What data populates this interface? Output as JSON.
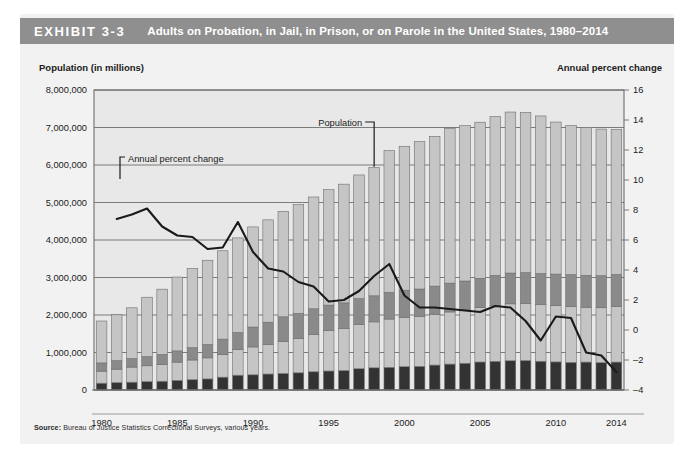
{
  "exhibit": {
    "label": "EXHIBIT 3-3",
    "title": "Adults on Probation, in Jail, in Prison, or on Parole in the United States, 1980–2014",
    "source_prefix": "Source:",
    "source_text": " Bureau of Justice Statistics Correctional Surveys, various years."
  },
  "axes": {
    "left_title": "Population (in millions)",
    "right_title": "Annual percent change"
  },
  "annotations": {
    "population": "Population",
    "annual_percent_change": "Annual percent change"
  },
  "colors": {
    "header_bar": "#8f8f8f",
    "panel_bg": "#f2f2f2",
    "plot_bg": "#e8e8e8",
    "jail": "#333333",
    "prison": "#c5c5c5",
    "parole": "#8a8a8a",
    "probation": "#c5c5c5",
    "line": "#1a1a1a",
    "grid": "#6e6e6e"
  },
  "chart_data": {
    "type": "bar",
    "title": "Adults on Probation, in Jail, in Prison, or on Parole in the United States, 1980–2014",
    "xlabel": "",
    "ylabel": "Population (in millions)",
    "y2label": "Annual percent change",
    "ylim": [
      0,
      8000000
    ],
    "y2lim": [
      -4,
      16
    ],
    "grid": true,
    "legend_position": "none",
    "ytick_labels": [
      "8,000,000",
      "7,000,000",
      "6,000,000",
      "5,000,000",
      "4,000,000",
      "3,000,000",
      "2,000,000",
      "1,000,000",
      "0"
    ],
    "ytick_values": [
      8000000,
      7000000,
      6000000,
      5000000,
      4000000,
      3000000,
      2000000,
      1000000,
      0
    ],
    "y2tick_labels": [
      "16",
      "14",
      "12",
      "10",
      "8",
      "6",
      "4",
      "2",
      "0",
      "–2",
      "–4"
    ],
    "y2tick_values": [
      16,
      14,
      12,
      10,
      8,
      6,
      4,
      2,
      0,
      -2,
      -4
    ],
    "xtick_labels": [
      "1980",
      "1985",
      "1990",
      "1995",
      "2000",
      "2005",
      "2010",
      "2014"
    ],
    "xtick_values": [
      1980,
      1985,
      1990,
      1995,
      2000,
      2005,
      2010,
      2014
    ],
    "categories": [
      1980,
      1981,
      1982,
      1983,
      1984,
      1985,
      1986,
      1987,
      1988,
      1989,
      1990,
      1991,
      1992,
      1993,
      1994,
      1995,
      1996,
      1997,
      1998,
      1999,
      2000,
      2001,
      2002,
      2003,
      2004,
      2005,
      2006,
      2007,
      2008,
      2009,
      2010,
      2011,
      2012,
      2013,
      2014
    ],
    "stack_order": [
      "jail",
      "prison",
      "parole",
      "probation"
    ],
    "series": [
      {
        "name": "Jail",
        "axis": "left",
        "color": "#333333",
        "values": [
          182000,
          196000,
          209000,
          223000,
          234000,
          256000,
          274000,
          295000,
          343000,
          395000,
          405000,
          426000,
          444000,
          459000,
          486000,
          507000,
          518000,
          567000,
          592000,
          605000,
          621000,
          631000,
          665000,
          691000,
          714000,
          747000,
          765000,
          780000,
          785000,
          767000,
          749000,
          736000,
          745000,
          731000,
          745000
        ]
      },
      {
        "name": "Prison",
        "axis": "left",
        "color": "#c5c5c5",
        "values": [
          320000,
          360000,
          402000,
          423000,
          449000,
          487000,
          526000,
          562000,
          607000,
          683000,
          743000,
          792000,
          850000,
          909000,
          990000,
          1078000,
          1127000,
          1176000,
          1224000,
          1287000,
          1316000,
          1330000,
          1355000,
          1390000,
          1421000,
          1448000,
          1492000,
          1518000,
          1519000,
          1514000,
          1500000,
          1485000,
          1462000,
          1463000,
          1478000
        ]
      },
      {
        "name": "Parole",
        "axis": "left",
        "color": "#8a8a8a",
        "values": [
          220000,
          225000,
          224000,
          246000,
          266000,
          300000,
          327000,
          356000,
          407000,
          456000,
          531000,
          590000,
          658000,
          676000,
          690000,
          679000,
          679000,
          694000,
          696000,
          714000,
          724000,
          732000,
          750000,
          769000,
          771000,
          784000,
          799000,
          821000,
          826000,
          824000,
          841000,
          855000,
          851000,
          853000,
          857000
        ]
      },
      {
        "name": "Probation",
        "axis": "left",
        "color": "#c5c5c5",
        "values": [
          1118000,
          1225000,
          1357000,
          1582000,
          1740000,
          1969000,
          2114000,
          2247000,
          2356000,
          2522000,
          2670000,
          2729000,
          2812000,
          2903000,
          2981000,
          3078000,
          3165000,
          3297000,
          3417000,
          3779000,
          3839000,
          3932000,
          3995000,
          4120000,
          4143000,
          4162000,
          4237000,
          4293000,
          4271000,
          4203000,
          4055000,
          3973000,
          3942000,
          3911000,
          3864000
        ]
      },
      {
        "name": "Annual percent change",
        "axis": "right",
        "color": "#1a1a1a",
        "type": "line",
        "values": [
          null,
          7.4,
          7.7,
          8.1,
          6.9,
          6.3,
          6.2,
          5.4,
          5.5,
          7.2,
          5.2,
          4.1,
          3.9,
          3.2,
          2.9,
          1.9,
          2.0,
          2.6,
          3.6,
          4.4,
          2.3,
          1.5,
          1.5,
          1.4,
          1.3,
          1.2,
          1.6,
          1.5,
          0.6,
          -0.7,
          0.9,
          0.8,
          -1.5,
          -1.7,
          -2.8
        ]
      }
    ]
  }
}
